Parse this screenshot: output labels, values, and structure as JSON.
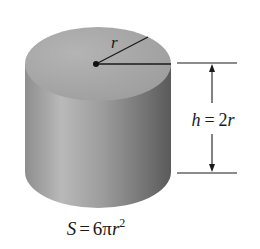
{
  "diagram": {
    "type": "cylinder-with-dimensions",
    "radius_label": "r",
    "height_label": {
      "var": "h",
      "eq": "=",
      "value": "2",
      "var2": "r"
    },
    "surface_label": {
      "var": "S",
      "eq": "=",
      "coef": "6",
      "pi": "π",
      "var2": "r",
      "exp": "2"
    }
  },
  "colors": {
    "top_face": "#a9a9a9",
    "side_light": "#b8b8b8",
    "side_dark": "#5e5e5e",
    "lines": "#1a1a1a",
    "background": "#ffffff"
  }
}
